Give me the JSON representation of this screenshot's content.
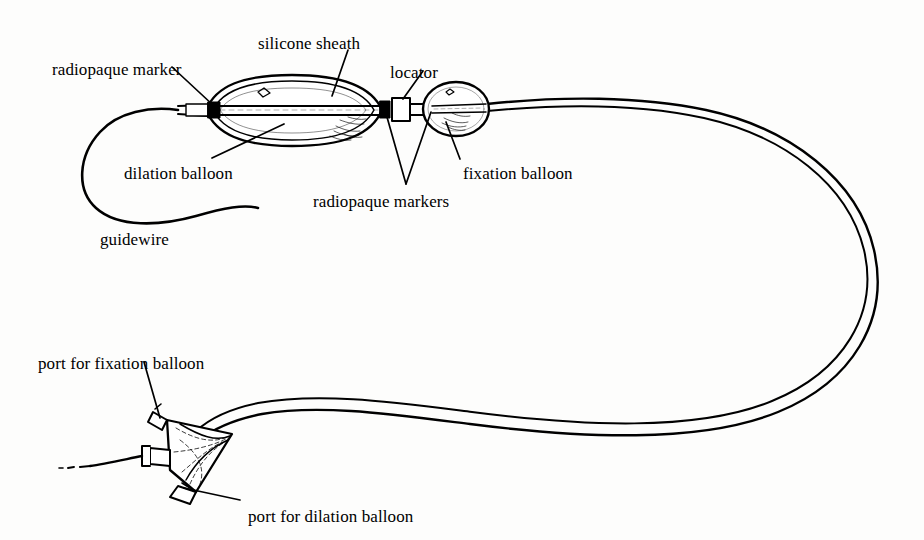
{
  "figure": {
    "kind": "line-drawing",
    "background_color": "#fdfdfc",
    "ink_color": "#000000"
  },
  "labels": [
    {
      "id": "silicone-sheath",
      "text": "silicone sheath",
      "x": 258,
      "y": 35,
      "anchor_x": 330,
      "anchor_y": 95
    },
    {
      "id": "radiopaque-marker",
      "text": "radiopaque marker",
      "x": 52,
      "y": 61,
      "anchor_x": 213,
      "anchor_y": 106
    },
    {
      "id": "locator",
      "text": "locator",
      "x": 390,
      "y": 64,
      "anchor_x": 404,
      "anchor_y": 100
    },
    {
      "id": "dilation-balloon",
      "text": "dilation balloon",
      "x": 124,
      "y": 165,
      "anchor_x": 277,
      "anchor_y": 126
    },
    {
      "id": "fixation-balloon",
      "text": "fixation balloon",
      "x": 463,
      "y": 165,
      "anchor_x": 447,
      "anchor_y": 119
    },
    {
      "id": "radiopaque-markers",
      "text": "radiopaque markers",
      "x": 313,
      "y": 193,
      "anchor_x": 382,
      "anchor_y": 108
    },
    {
      "id": "guidewire",
      "text": "guidewire",
      "x": 100,
      "y": 231,
      "anchor_x": 148,
      "anchor_y": 212
    },
    {
      "id": "port-for-fixation-balloon",
      "text": "port for fixation balloon",
      "x": 38,
      "y": 355,
      "anchor_x": 157,
      "anchor_y": 419
    },
    {
      "id": "port-for-dilation-balloon",
      "text": "port for dilation balloon",
      "x": 248,
      "y": 508,
      "anchor_x": 178,
      "anchor_y": 487
    }
  ],
  "parts": {
    "dilation_balloon": {
      "name": "dilation balloon",
      "shape": "elongated-ellipse",
      "cx": 292,
      "cy": 111,
      "rx": 90,
      "ry": 34
    },
    "fixation_balloon": {
      "name": "fixation balloon",
      "shape": "oval",
      "cx": 456,
      "cy": 109,
      "rx": 33,
      "ry": 26
    },
    "locator": {
      "name": "locator",
      "shape": "collar",
      "x": 396,
      "y": 100
    },
    "markers": [
      {
        "name": "distal radiopaque marker",
        "x": 214,
        "y": 108
      },
      {
        "name": "mid radiopaque marker",
        "x": 385,
        "y": 109
      },
      {
        "name": "proximal radiopaque marker",
        "x": 430,
        "y": 110
      }
    ],
    "hub": {
      "name": "three-port hub",
      "shape": "triangular-manifold",
      "cx": 185,
      "cy": 445
    },
    "guidewire": {
      "name": "guidewire",
      "shape": "open-loop"
    },
    "shaft": {
      "name": "catheter shaft",
      "shape": "double-line-tube"
    }
  }
}
